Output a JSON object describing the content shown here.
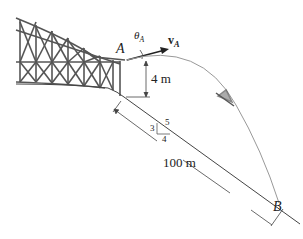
{
  "diagram": {
    "labels": {
      "point_a": "A",
      "point_b": "B",
      "theta": "θ",
      "theta_sub": "A",
      "velocity": "v",
      "velocity_sub": "A",
      "height": "4 m",
      "distance": "100 m",
      "slope_rise": "3",
      "slope_run": "4",
      "slope_hyp": "5"
    },
    "colors": {
      "line": "#333333",
      "trajectory": "#888888",
      "structure": "#555555",
      "ground": "#444444"
    }
  }
}
